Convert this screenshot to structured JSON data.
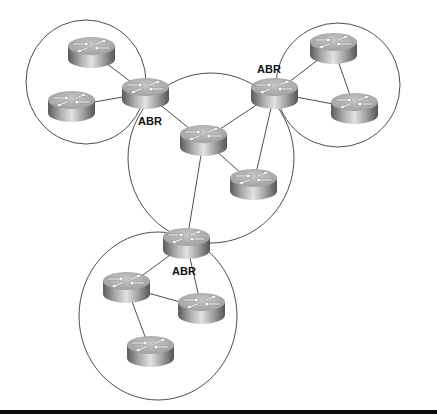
{
  "diagram": {
    "type": "network-topology",
    "colors": {
      "background": "#ffffff",
      "area_outline": "#3a3a3a",
      "link": "#3a3a3a",
      "router_top": "#b8b8b8",
      "router_body_dark": "#5a5a5a",
      "router_body_light": "#e0e0e0",
      "label": "#111111",
      "bottom_bar": "#0d0d0d"
    },
    "areas": [
      {
        "id": "area-top-left",
        "cx": 86,
        "cy": 82,
        "rx": 60,
        "ry": 62
      },
      {
        "id": "area-top-right",
        "cx": 338,
        "cy": 85,
        "rx": 62,
        "ry": 62
      },
      {
        "id": "area-center",
        "cx": 211,
        "cy": 158,
        "rx": 83,
        "ry": 85
      },
      {
        "id": "area-bottom",
        "cx": 158,
        "cy": 316,
        "rx": 79,
        "ry": 84
      }
    ],
    "routers": [
      {
        "id": "r-tl-1",
        "x": 68,
        "y": 37,
        "abr": false
      },
      {
        "id": "r-tl-2",
        "x": 48,
        "y": 91,
        "abr": false
      },
      {
        "id": "abr-left",
        "x": 122,
        "y": 78,
        "abr": true
      },
      {
        "id": "abr-right",
        "x": 251,
        "y": 78,
        "abr": true
      },
      {
        "id": "r-tr-1",
        "x": 310,
        "y": 33,
        "abr": false
      },
      {
        "id": "r-tr-2",
        "x": 331,
        "y": 93,
        "abr": false
      },
      {
        "id": "r-c-1",
        "x": 180,
        "y": 125,
        "abr": false
      },
      {
        "id": "r-c-2",
        "x": 230,
        "y": 169,
        "abr": false
      },
      {
        "id": "abr-bottom",
        "x": 163,
        "y": 228,
        "abr": true
      },
      {
        "id": "r-b-1",
        "x": 103,
        "y": 272,
        "abr": false
      },
      {
        "id": "r-b-2",
        "x": 178,
        "y": 293,
        "abr": false
      },
      {
        "id": "r-b-3",
        "x": 127,
        "y": 336,
        "abr": false
      }
    ],
    "labels": {
      "abr_left": "ABR",
      "abr_right": "ABR",
      "abr_bottom": "ABR"
    },
    "links": [
      [
        "r-tl-1",
        "abr-left"
      ],
      [
        "r-tl-2",
        "abr-left"
      ],
      [
        "abr-left",
        "r-c-1"
      ],
      [
        "abr-right",
        "r-c-1"
      ],
      [
        "abr-right",
        "r-c-2"
      ],
      [
        "r-c-1",
        "r-c-2"
      ],
      [
        "r-c-1",
        "abr-bottom"
      ],
      [
        "abr-right",
        "r-tr-1"
      ],
      [
        "abr-right",
        "r-tr-2"
      ],
      [
        "r-tr-1",
        "r-tr-2"
      ],
      [
        "abr-bottom",
        "r-b-1"
      ],
      [
        "abr-bottom",
        "r-b-2"
      ],
      [
        "r-b-1",
        "r-b-2"
      ],
      [
        "r-b-1",
        "r-b-3"
      ]
    ]
  }
}
